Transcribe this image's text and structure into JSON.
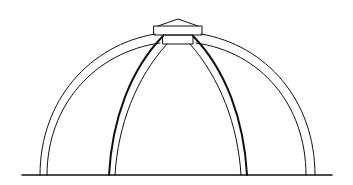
{
  "diagram": {
    "stroke_color": "#111111",
    "background_color": "#ffffff",
    "parts": [
      "ground-line",
      "outer-shell-arc",
      "inner-shell-arc",
      "left-rib",
      "right-rib",
      "lantern-roof",
      "lantern-box",
      "drum-box"
    ]
  }
}
